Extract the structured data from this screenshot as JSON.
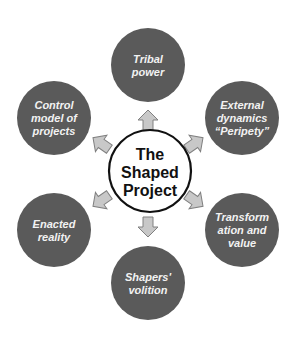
{
  "diagram": {
    "center": {
      "label_lines": [
        "The",
        "Shaped",
        "Project"
      ]
    },
    "satellites": [
      {
        "id": "tribal-power",
        "label_lines": [
          "Tribal",
          "power"
        ]
      },
      {
        "id": "external-dynamics",
        "label_lines": [
          "External",
          "dynamics",
          "“Peripety”"
        ]
      },
      {
        "id": "transformation-and-value",
        "label_lines": [
          "Transform",
          "ation and",
          "value"
        ]
      },
      {
        "id": "shapers-volition",
        "label_lines": [
          "Shapers'",
          "volition"
        ]
      },
      {
        "id": "enacted-reality",
        "label_lines": [
          "Enacted",
          "reality"
        ]
      },
      {
        "id": "control-model",
        "label_lines": [
          "Control",
          "model of",
          "projects"
        ]
      }
    ],
    "colors": {
      "satellite_fill": "#5a5a5a",
      "arrow_fill": "#c8c8c8",
      "arrow_stroke": "#808080",
      "center_stroke": "#111111"
    }
  }
}
